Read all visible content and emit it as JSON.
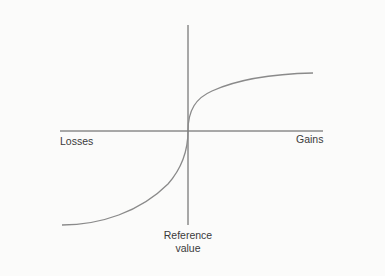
{
  "diagram": {
    "title": "",
    "type": "value-function",
    "labels": {
      "x_negative": "Losses",
      "x_positive": "Gains",
      "origin_line1": "Reference",
      "origin_line2": "value"
    },
    "curve": {
      "description": "S-shaped value function: concave for gains, convex and steeper for losses",
      "color": "#8a8a8a"
    },
    "axis_color": "#555555"
  }
}
